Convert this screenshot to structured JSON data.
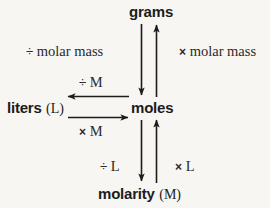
{
  "diagram": {
    "background_color": "#f7f6f3",
    "ink_color": "#1c1c1c",
    "nodes": [
      {
        "id": "grams",
        "name": "grams",
        "symbol": ""
      },
      {
        "id": "moles",
        "name": "moles",
        "symbol": ""
      },
      {
        "id": "liters",
        "name": "liters",
        "symbol": "(L)"
      },
      {
        "id": "molarity",
        "name": "molarity",
        "symbol": "(M)"
      }
    ],
    "operations": [
      {
        "id": "divide-molar-mass",
        "operator": "÷",
        "text": "molar mass",
        "from": "grams",
        "to": "moles"
      },
      {
        "id": "times-molar-mass",
        "operator": "×",
        "text": "molar mass",
        "from": "moles",
        "to": "grams"
      },
      {
        "id": "divide-m",
        "operator": "÷",
        "text": "M",
        "from": "moles",
        "to": "liters"
      },
      {
        "id": "times-m",
        "operator": "×",
        "text": "M",
        "from": "liters",
        "to": "moles"
      },
      {
        "id": "divide-l",
        "operator": "÷",
        "text": "L",
        "from": "moles",
        "to": "molarity"
      },
      {
        "id": "times-l",
        "operator": "×",
        "text": "L",
        "from": "molarity",
        "to": "moles"
      }
    ]
  }
}
